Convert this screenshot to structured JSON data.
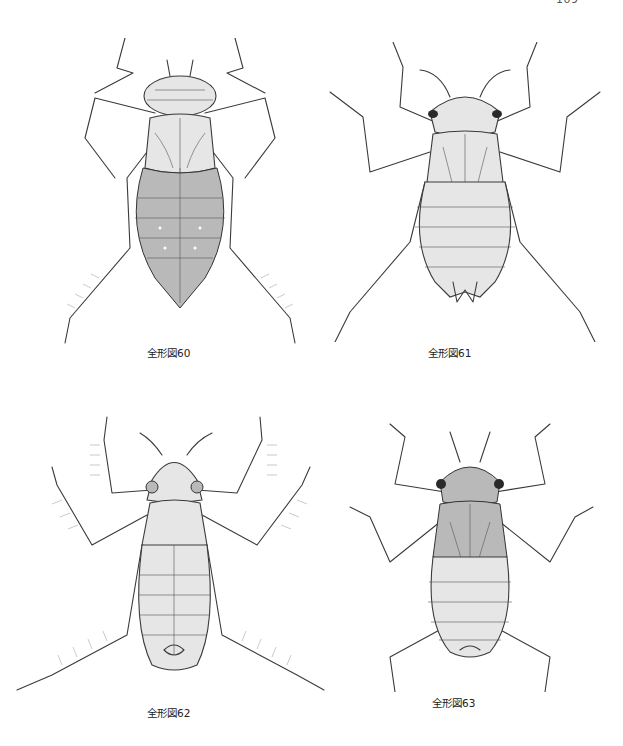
{
  "page": {
    "page_number": "109"
  },
  "figures": [
    {
      "caption": "全形図60",
      "subject": "dragonfly-larva-illustration",
      "style": "pencil line drawing, dorsal view, stout hairy body"
    },
    {
      "caption": "全形図61",
      "subject": "dragonfly-larva-illustration",
      "style": "pencil line drawing, dorsal view, slender legs, spined abdomen tip"
    },
    {
      "caption": "全形図62",
      "subject": "dragonfly-larva-illustration",
      "style": "pencil line drawing, dorsal view, heavily fringed legs"
    },
    {
      "caption": "全形図63",
      "subject": "dragonfly-larva-illustration",
      "style": "pencil line drawing, dorsal view, dark patterned thorax"
    }
  ]
}
